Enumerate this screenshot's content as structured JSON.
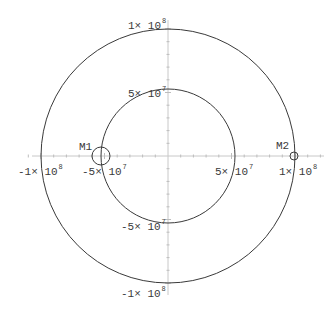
{
  "diagram": {
    "type": "orbit-plot",
    "center_px": [
      168,
      156
    ],
    "px_per_unit_1e7": 12.7,
    "colors": {
      "axis": "#c8c8c8",
      "tick": "#bdbdbd",
      "orbit": "#3a3a3a",
      "marker": "#3a3a3a",
      "text": "#3a3a3a",
      "background": "#ffffff"
    },
    "orbits": [
      {
        "name": "outer-orbit",
        "radius": 100000000,
        "radius_px": 127
      },
      {
        "name": "inner-orbit",
        "radius": 50000000,
        "radius_px": 67
      }
    ],
    "bodies": [
      {
        "name": "M1",
        "label": "M1",
        "x": -50000000,
        "y": 0,
        "cx": 101,
        "cy": 156,
        "r": 9,
        "label_x": 79,
        "label_y": 150
      },
      {
        "name": "M2",
        "label": "M2",
        "x": 100000000,
        "y": 0,
        "cx": 294,
        "cy": 156,
        "r": 4,
        "label_x": 276,
        "label_y": 149
      }
    ],
    "x_axis": {
      "tick_labels": [
        {
          "mant": "-1× 10",
          "exp": "8",
          "value": -100000000,
          "x": 18,
          "y": 175
        },
        {
          "mant": "-5× 10",
          "exp": "7",
          "value": -50000000,
          "x": 82,
          "y": 175
        },
        {
          "mant": "5× 10",
          "exp": "7",
          "value": 50000000,
          "x": 215,
          "y": 175
        },
        {
          "mant": "1× 10",
          "exp": "8",
          "value": 100000000,
          "x": 279,
          "y": 175
        }
      ]
    },
    "y_axis": {
      "tick_labels": [
        {
          "mant": "1× 10",
          "exp": "8",
          "value": 100000000,
          "x": 128,
          "y": 29
        },
        {
          "mant": "5× 10",
          "exp": "7",
          "value": 50000000,
          "x": 128,
          "y": 97
        },
        {
          "mant": "-5× 10",
          "exp": "7",
          "value": -50000000,
          "x": 121,
          "y": 230
        },
        {
          "mant": "-1× 10",
          "exp": "8",
          "value": -100000000,
          "x": 121,
          "y": 297
        }
      ]
    }
  }
}
